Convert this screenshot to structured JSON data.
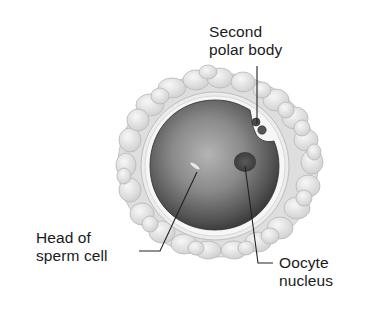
{
  "diagram": {
    "labels": {
      "second_polar_body": {
        "line1": "Second",
        "line2": "polar body"
      },
      "head_of_sperm_cell": {
        "line1": "Head of",
        "line2": "sperm cell"
      },
      "oocyte_nucleus": {
        "line1": "Oocyte",
        "line2": "nucleus"
      }
    },
    "structures": [
      "corona-radiata",
      "zona-pellucida",
      "oocyte-cytoplasm",
      "oocyte-nucleus",
      "sperm-head",
      "second-polar-body"
    ],
    "colors": {
      "background": "#ffffff",
      "corona": "#e4e4e4",
      "corona_outline": "#bdbdbd",
      "zona": "#f4f4f4",
      "oocyte_dark": "#3a3a3a",
      "oocyte_light": "#a8a8a8",
      "nucleus": "#4a4a4a",
      "leader_line": "#222222",
      "text": "#1a1a1a"
    }
  }
}
